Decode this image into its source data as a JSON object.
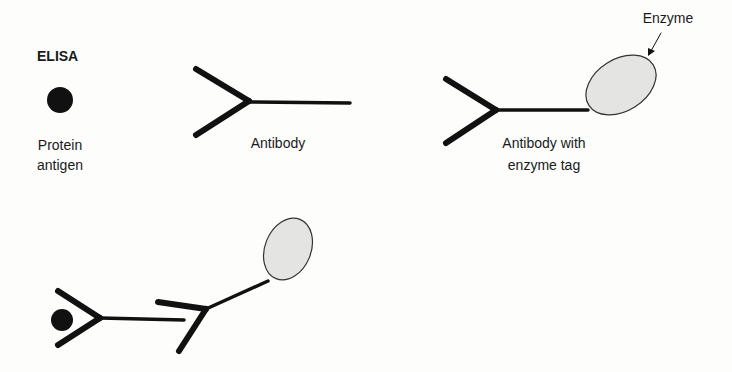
{
  "title": "ELISA",
  "labels": {
    "protein_antigen": [
      "Protein",
      "antigen"
    ],
    "antibody": "Antibody",
    "antibody_enzyme": [
      "Antibody with",
      "enzyme tag"
    ],
    "enzyme": "Enzyme"
  },
  "colors": {
    "stroke": "#111111",
    "enzyme_fill": "#e4e4e2",
    "background": "#fdfdfb"
  }
}
